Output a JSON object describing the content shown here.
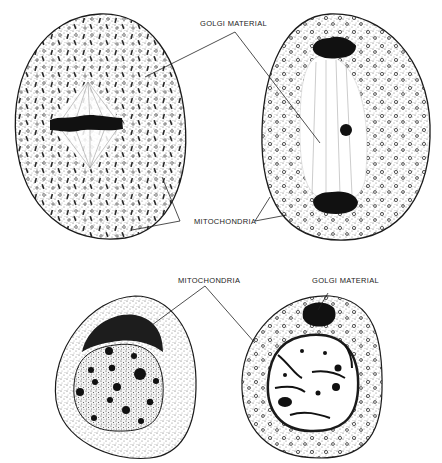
{
  "figure": {
    "colors": {
      "ink": "#1a1a1a",
      "stipple": "#555555",
      "background": "#ffffff"
    },
    "labels": {
      "top_golgi": "GOLGI MATERIAL",
      "top_mito": "MITOCHONDRIA",
      "bottom_mito": "MITOCHONDRIA",
      "bottom_golgi": "GOLGI MATERIAL"
    },
    "cells": [
      {
        "id": "top-left",
        "stage": "metaphase",
        "features": [
          "metaphase plate",
          "spindle",
          "rod-shaped golgi",
          "granular mitochondria"
        ]
      },
      {
        "id": "top-right",
        "stage": "anaphase",
        "features": [
          "two chromosome groups",
          "spindle",
          "central golgi body",
          "granular mitochondria"
        ]
      },
      {
        "id": "bottom-left",
        "stage": "resting",
        "features": [
          "golgi cap",
          "nucleus with nucleoli"
        ]
      },
      {
        "id": "bottom-right",
        "stage": "resting",
        "features": [
          "golgi body",
          "reticulate nucleus",
          "ring of mitochondria"
        ]
      }
    ]
  }
}
